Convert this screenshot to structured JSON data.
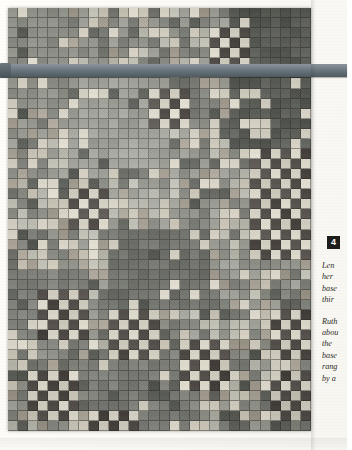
{
  "figure": {
    "number": "4",
    "badge_color": "#1d1d1b",
    "badge_text_color": "#ffffff"
  },
  "caption": {
    "paragraphs": [
      {
        "lines": [
          "Len",
          "her",
          "base",
          "thir"
        ]
      },
      {
        "lines": [
          "Ruth",
          "abou",
          "the ",
          "base",
          "rang",
          "by a"
        ]
      }
    ]
  },
  "artifact": {
    "name": "patchwork-quilt",
    "rod": {
      "name": "hanging-rod",
      "color": "#636f76"
    },
    "grid": {
      "columns": 30,
      "rows": 42
    },
    "palette": {
      "light_grey": "#b9b9ae",
      "pale_cream": "#cfcabb",
      "mid_grey": "#9a9b92",
      "medium_grey": "#8a8b82",
      "slate_grey": "#7b7d76",
      "dark_slate": "#686a63",
      "deep_charcoal": "#555751",
      "maroon_dark": "#4a4540",
      "warm_taupe": "#a39c8f",
      "highlight": "#d8d4c6"
    }
  },
  "page": {
    "background": "#fdfdfb"
  }
}
